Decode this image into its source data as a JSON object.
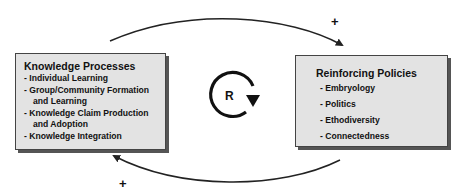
{
  "left_box": {
    "title": "Knowledge Processes",
    "items": [
      "- Individual Learning",
      "- Group/Community Formation",
      "and Learning",
      "- Knowledge Claim Production",
      "and  Adoption",
      "- Knowledge Integration"
    ]
  },
  "right_box": {
    "title": "Reinforcing Policies",
    "items": [
      "- Embryology",
      "- Politics",
      "- Ethodiversity",
      "- Connectedness"
    ]
  },
  "loop": {
    "label": "R",
    "type": "reinforcing"
  },
  "arrows": {
    "top_sign": "+",
    "bottom_sign": "+"
  },
  "colors": {
    "box_fill": "#e3e3e3",
    "stroke": "#222222"
  }
}
